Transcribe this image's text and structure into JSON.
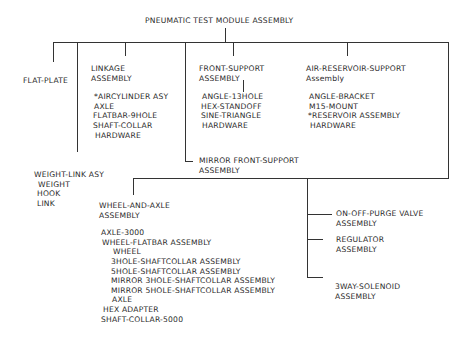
{
  "title": "PNEUMATIC TEST MODULE ASSEMBLY",
  "nodes": {
    "flat_plate": "FLAT-PLATE",
    "linkage": {
      "title": [
        "LINKAGE",
        "ASSEMBLY"
      ],
      "items": [
        "*AIRCYLINDER ASY",
        "AXLE",
        "FLATBAR-9HOLE",
        "SHAFT-COLLAR",
        "HARDWARE"
      ]
    },
    "front_support": {
      "title": [
        "FRONT-SUPPORT",
        "ASSEMBLY"
      ],
      "items": [
        "ANGLE-13HOLE",
        "HEX-STANDOFF",
        "SINE-TRIANGLE",
        "HARDWARE"
      ]
    },
    "air_reservoir_support": {
      "title": [
        "AIR-RESERVOIR-SUPPORT",
        "Assembly"
      ],
      "items": [
        "ANGLE-BRACKET",
        "M15-MOUNT",
        "*RESERVOIR ASSEMBLY",
        "HARDWARE"
      ]
    },
    "weight_link": {
      "title": "WEIGHT-LINK ASY",
      "items": [
        "WEIGHT",
        "HOOK",
        "LINK"
      ]
    },
    "mirror_front_support": [
      "MIRROR FRONT-SUPPORT",
      "ASSEMBLY"
    ],
    "wheel_and_axle": {
      "title": [
        "WHEEL-AND-AXLE",
        "ASSEMBLY"
      ],
      "items": [
        "AXLE-3000",
        "WHEEL-FLATBAR ASSEMBLY"
      ],
      "sub_items": [
        "WHEEL",
        "3HOLE-SHAFTCOLLAR ASSEMBLY",
        "5HOLE-SHAFTCOLLAR ASSEMBLY",
        "MIRROR 3HOLE-SHAFTCOLLAR ASSEMBLY",
        "MIRROR 5HOLE-SHAFTCOLLAR ASSEMBLY",
        "AXLE"
      ],
      "tail_items": [
        "HEX ADAPTER",
        "SHAFT-COLLAR-5000"
      ]
    },
    "on_off_purge": [
      "ON-OFF-PURGE VALVE",
      "ASSEMBLY"
    ],
    "regulator": [
      "REGULATOR",
      "ASSEMBLY"
    ],
    "solenoid": [
      "3WAY-SOLENOID",
      "ASSEMBLY"
    ]
  }
}
